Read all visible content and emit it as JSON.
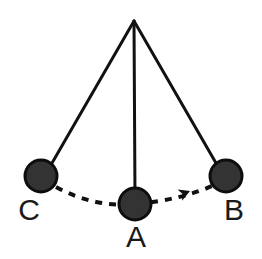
{
  "figure": {
    "background_color": "#ffffff",
    "width": 262,
    "height": 259
  },
  "style": {
    "bob_fill": "#333333",
    "bob_stroke": "#0d0d0d",
    "bob_stroke_width": 3,
    "string_color": "#111111",
    "string_width": 3,
    "arc_color": "#111111",
    "arc_width": 4,
    "arc_dash": "7 7",
    "label_color": "#1a1a1a",
    "label_font_size": 30
  },
  "pivot": {
    "name": "pivot-point",
    "x": 134,
    "y": 21
  },
  "bobs": [
    {
      "id": "C",
      "label": "C",
      "cx": 41,
      "cy": 176,
      "r": 16,
      "label_x": 29,
      "label_y": 220,
      "has_string": true
    },
    {
      "id": "A",
      "label": "A",
      "cx": 135,
      "cy": 204,
      "r": 16,
      "label_x": 136,
      "label_y": 247,
      "has_string": true
    },
    {
      "id": "B",
      "label": "B",
      "cx": 226,
      "cy": 176,
      "r": 16,
      "label_x": 234,
      "label_y": 220,
      "has_string": true
    }
  ],
  "strings": [
    {
      "id": "string-to-C",
      "x1": 134,
      "y1": 21,
      "x2": 48,
      "y2": 170
    },
    {
      "id": "string-to-A",
      "x1": 134,
      "y1": 21,
      "x2": 135,
      "y2": 198
    },
    {
      "id": "string-to-B",
      "x1": 134,
      "y1": 21,
      "x2": 220,
      "y2": 170
    }
  ],
  "swing_arc": {
    "name": "swing-path",
    "path": "M 56 187 Q 95 208 135 204 Q 180 200 212 186",
    "direction": "C-to-B",
    "arrowhead": {
      "x": 190,
      "y": 191,
      "angle_deg": -22
    }
  }
}
